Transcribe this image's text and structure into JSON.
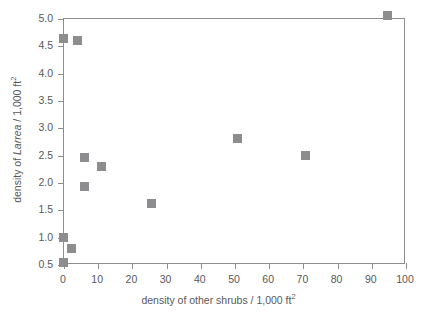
{
  "chart_data": {
    "type": "scatter",
    "title": "",
    "xlabel": "density of other shrubs / 1,000 ft",
    "xlabel_sup": "2",
    "ylabel_prefix": "density of ",
    "ylabel_italic": "Larrea",
    "ylabel_suffix": " / 1,000 ft",
    "ylabel_sup": "2",
    "xlim": [
      0,
      100
    ],
    "ylim": [
      0.5,
      5.0
    ],
    "xticks": [
      0,
      10,
      20,
      30,
      40,
      50,
      60,
      70,
      80,
      90,
      100
    ],
    "xtick_labels": [
      "0",
      "10",
      "20",
      "30",
      "40",
      "50",
      "60",
      "70",
      "80",
      "90",
      "100"
    ],
    "yticks": [
      0.5,
      1.0,
      1.5,
      2.0,
      2.5,
      3.0,
      3.5,
      4.0,
      4.5,
      5.0
    ],
    "ytick_labels": [
      "0.5",
      "1.0",
      "1.5",
      "2.0",
      "2.5",
      "3.0",
      "3.5",
      "4.0",
      "4.5",
      "5.0"
    ],
    "grid": false,
    "legend": false,
    "marker": "square",
    "marker_color": "#8d8d8f",
    "frame_color": "#8e8e90",
    "text_color": "#58585a",
    "background": "#ffffff",
    "points": [
      {
        "x": 0.0,
        "y": 4.63
      },
      {
        "x": 4.1,
        "y": 4.58
      },
      {
        "x": 6.4,
        "y": 2.44
      },
      {
        "x": 11.4,
        "y": 2.29
      },
      {
        "x": 6.4,
        "y": 1.92
      },
      {
        "x": 26.0,
        "y": 1.6
      },
      {
        "x": 51.0,
        "y": 2.79
      },
      {
        "x": 71.0,
        "y": 2.48
      },
      {
        "x": 95.0,
        "y": 5.05
      },
      {
        "x": 0.0,
        "y": 0.98
      },
      {
        "x": 2.6,
        "y": 0.79
      },
      {
        "x": 0.0,
        "y": 0.52
      }
    ]
  }
}
